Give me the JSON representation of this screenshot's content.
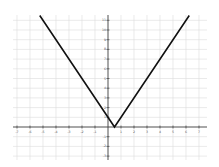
{
  "chart_data": {
    "type": "line",
    "title": "",
    "xlabel": "",
    "ylabel": "",
    "function": "y = |2x - 1|",
    "xlim": [
      -7.5,
      7.5
    ],
    "ylim": [
      -3.4,
      11.5
    ],
    "grid": true,
    "x_ticks": [
      -7,
      -6,
      -5,
      -4,
      -3,
      -2,
      -1,
      1,
      2,
      3,
      4,
      5,
      6,
      7
    ],
    "y_ticks": [
      11,
      10,
      9,
      8,
      7,
      6,
      5,
      4,
      3,
      2,
      1,
      -1,
      -2,
      -3
    ],
    "series": [
      {
        "name": "absolute value",
        "color": "#111111",
        "x": [
          -5.25,
          0.5,
          6.25
        ],
        "y": [
          11.5,
          0,
          11.5
        ]
      }
    ]
  }
}
